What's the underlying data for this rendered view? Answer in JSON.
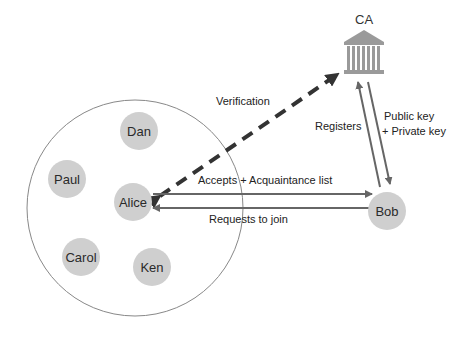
{
  "diagram": {
    "ca": {
      "label": "CA",
      "icon": "bank-building-icon"
    },
    "group_nodes": [
      {
        "id": "dan",
        "label": "Dan"
      },
      {
        "id": "paul",
        "label": "Paul"
      },
      {
        "id": "alice",
        "label": "Alice"
      },
      {
        "id": "carol",
        "label": "Carol"
      },
      {
        "id": "ken",
        "label": "Ken"
      }
    ],
    "external_node": {
      "id": "bob",
      "label": "Bob"
    },
    "edges": {
      "verification": "Verification",
      "accepts": "Accepts + Acquaintance list",
      "requests": "Requests to join",
      "registers": "Registers",
      "keys_line1": "Public key",
      "keys_line2": "+ Private key"
    },
    "colors": {
      "node_fill": "#cfcfcf",
      "arrow": "#666666",
      "dashed_arrow": "#333333",
      "group_circle": "#888888"
    }
  }
}
